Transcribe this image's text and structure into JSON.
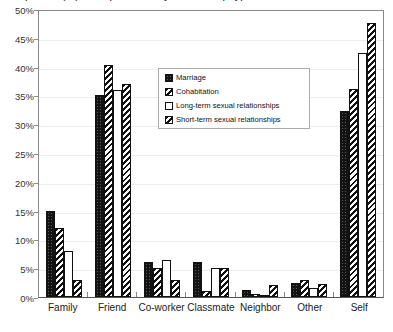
{
  "chart_data": {
    "type": "bar",
    "title": "Proportion (%) of respondents by relationship type",
    "xlabel": "",
    "ylabel": "",
    "ylim": [
      0,
      50
    ],
    "ytick_step": 5,
    "ytick_labels": [
      "50%",
      "45%",
      "40%",
      "35%",
      "30%",
      "25%",
      "20%",
      "15%",
      "10%",
      "5%",
      "0%"
    ],
    "grid": true,
    "legend_position": "inside-top-center",
    "categories": [
      "Family",
      "Friend",
      "Co-worker",
      "Classmate",
      "Neighbor",
      "Other",
      "Self"
    ],
    "series": [
      {
        "name": "Marriage",
        "fill": "black-dotted",
        "values": [
          15.0,
          35.0,
          6.0,
          6.0,
          1.2,
          2.5,
          32.3
        ]
      },
      {
        "name": "Cohabitation",
        "fill": "diagonal-hatch",
        "values": [
          12.0,
          40.3,
          5.0,
          1.0,
          0.6,
          3.0,
          36.2
        ]
      },
      {
        "name": "Long-term sexual relationships",
        "fill": "white",
        "values": [
          8.0,
          36.0,
          6.5,
          5.0,
          0.4,
          1.5,
          42.3
        ]
      },
      {
        "name": "Short-term sexual relationships",
        "fill": "diagonal-hatch",
        "values": [
          3.0,
          37.0,
          3.0,
          5.0,
          2.0,
          2.3,
          47.5
        ]
      }
    ]
  }
}
